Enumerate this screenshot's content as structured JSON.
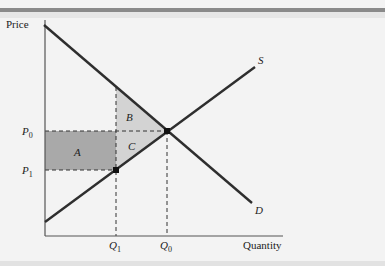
{
  "figure": {
    "y_axis_label": "Price",
    "x_axis_label": "Quantity",
    "curves": {
      "supply": {
        "label": "S"
      },
      "demand": {
        "label": "D"
      }
    },
    "price_ticks": [
      {
        "sym": "P",
        "sub": "0"
      },
      {
        "sym": "P",
        "sub": "1"
      }
    ],
    "quantity_ticks": [
      {
        "sym": "Q",
        "sub": "1"
      },
      {
        "sym": "Q",
        "sub": "0"
      }
    ],
    "regions": {
      "a": "A",
      "b": "B",
      "c": "C"
    },
    "colors": {
      "line": "#2e2e2e",
      "region_a": "#a9a9a9",
      "region_bc": "#d3d3d3",
      "background": "#f3f3f3"
    }
  }
}
